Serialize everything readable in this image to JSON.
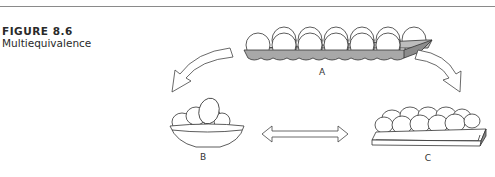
{
  "figure": {
    "number": "FIGURE 8.6",
    "title": "Multiequivalence"
  },
  "diagram": {
    "nodes": [
      {
        "id": "A",
        "label": "A",
        "depiction": "egg carton with dozen eggs"
      },
      {
        "id": "B",
        "label": "B",
        "depiction": "bowl of eggs"
      },
      {
        "id": "C",
        "label": "C",
        "depiction": "flat tray of eggs"
      }
    ],
    "edges": [
      {
        "from": "A",
        "to": "B",
        "style": "curved hollow arrow"
      },
      {
        "from": "A",
        "to": "C",
        "style": "curved hollow arrow"
      },
      {
        "from": "B",
        "to": "C",
        "style": "double-headed hollow arrow"
      }
    ],
    "colors": {
      "line": "#333333",
      "carton_fill": "#a8a8a8",
      "egg_fill": "#ffffff"
    }
  }
}
